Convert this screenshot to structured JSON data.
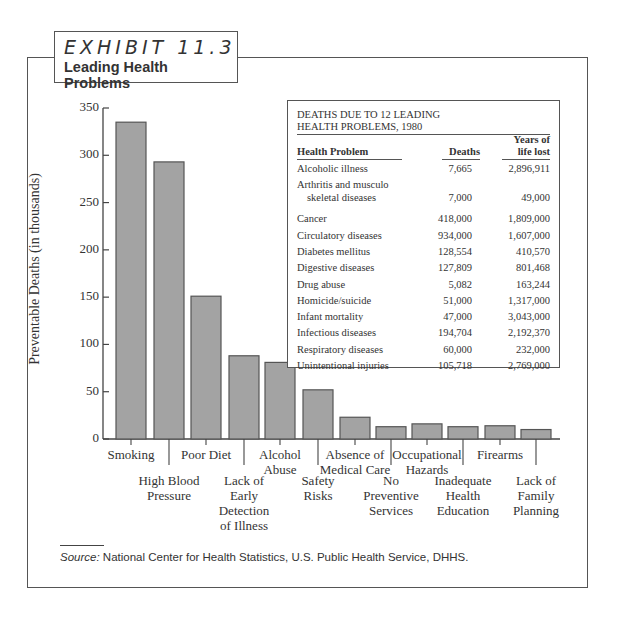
{
  "header": {
    "exhibit": "EXHIBIT 11.3",
    "title": "Leading Health Problems"
  },
  "chart_data": {
    "type": "bar",
    "title": "Leading Health Problems",
    "xlabel": "",
    "ylabel": "Preventable Deaths (in thousands)",
    "ylim": [
      0,
      350
    ],
    "yticks": [
      0,
      50,
      100,
      150,
      200,
      250,
      300,
      350
    ],
    "grid": false,
    "categories": [
      "Smoking",
      "High Blood Pressure",
      "Poor Diet",
      "Lack of Early Detection of Illness",
      "Alcohol Abuse",
      "Safety Risks",
      "Absence of Medical Care",
      "No Preventive Services",
      "Occupational Hazards",
      "Inadequate Health Education",
      "Firearms",
      "Lack of Family Planning"
    ],
    "values": [
      335,
      293,
      151,
      88,
      81,
      52,
      23,
      13,
      16,
      13,
      14,
      10
    ],
    "bar_color": "#a3a3a3"
  },
  "axis": {
    "ylabel": "Preventable Deaths (in thousands)",
    "ticks": [
      "0",
      "50",
      "100",
      "150",
      "200",
      "250",
      "300",
      "350"
    ]
  },
  "xlabels": [
    {
      "lines": [
        "Smoking"
      ]
    },
    {
      "lines": [
        "High Blood",
        "Pressure"
      ]
    },
    {
      "lines": [
        "Poor Diet"
      ]
    },
    {
      "lines": [
        "Lack of",
        "Early",
        "Detection",
        "of Illness"
      ]
    },
    {
      "lines": [
        "Alcohol",
        "Abuse"
      ]
    },
    {
      "lines": [
        "Safety",
        "Risks"
      ]
    },
    {
      "lines": [
        "Absence of",
        "Medical Care"
      ]
    },
    {
      "lines": [
        "No",
        "Preventive",
        "Services"
      ]
    },
    {
      "lines": [
        "Occupational",
        "Hazards"
      ]
    },
    {
      "lines": [
        "Inadequate",
        "Health",
        "Education"
      ]
    },
    {
      "lines": [
        "Firearms"
      ]
    },
    {
      "lines": [
        "Lack of",
        "Family",
        "Planning"
      ]
    }
  ],
  "table": {
    "title_line1": "DEATHS DUE TO 12 LEADING",
    "title_line2": "HEALTH PROBLEMS, 1980",
    "col_problem": "Health Problem",
    "col_deaths": "Deaths",
    "col_years_1": "Years of",
    "col_years_2": "life lost",
    "rows": [
      {
        "problem": "Alcoholic illness",
        "deaths": "7,665",
        "years": "2,896,911"
      },
      {
        "problem": "Arthritis and musculo",
        "problem2": "skeletal diseases",
        "deaths": "7,000",
        "years": "49,000"
      },
      {
        "problem": "Cancer",
        "deaths": "418,000",
        "years": "1,809,000"
      },
      {
        "problem": "Circulatory diseases",
        "deaths": "934,000",
        "years": "1,607,000"
      },
      {
        "problem": "Diabetes mellitus",
        "deaths": "128,554",
        "years": "410,570"
      },
      {
        "problem": "Digestive diseases",
        "deaths": "127,809",
        "years": "801,468"
      },
      {
        "problem": "Drug abuse",
        "deaths": "5,082",
        "years": "163,244"
      },
      {
        "problem": "Homicide/suicide",
        "deaths": "51,000",
        "years": "1,317,000"
      },
      {
        "problem": "Infant mortality",
        "deaths": "47,000",
        "years": "3,043,000"
      },
      {
        "problem": "Infectious diseases",
        "deaths": "194,704",
        "years": "2,192,370"
      },
      {
        "problem": "Respiratory diseases",
        "deaths": "60,000",
        "years": "232,000"
      },
      {
        "problem": "Unintentional injuries",
        "deaths": "105,718",
        "years": "2,769,000"
      }
    ]
  },
  "source": {
    "label": "Source:",
    "text": " National Center for Health Statistics, U.S. Public Health Service, DHHS."
  }
}
